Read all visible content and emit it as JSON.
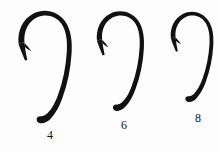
{
  "figure": {
    "background_color": "#fdfdfd",
    "ink_color": "#111111",
    "label_color": "#131313"
  },
  "hooks": [
    {
      "id": "hook-size-4",
      "label": "4",
      "size_number": 4,
      "relative_scale": 1.0,
      "label_x": 50,
      "label_y": 129,
      "bbox": {
        "x": 14,
        "y": 10,
        "width": 58,
        "height": 114
      }
    },
    {
      "id": "hook-size-6",
      "label": "6",
      "size_number": 6,
      "relative_scale": 0.885,
      "label_x": 124,
      "label_y": 119,
      "bbox": {
        "x": 94,
        "y": 10,
        "width": 51,
        "height": 104
      }
    },
    {
      "id": "hook-size-8",
      "label": "8",
      "size_number": 8,
      "relative_scale": 0.8,
      "label_x": 198,
      "label_y": 112,
      "bbox": {
        "x": 167,
        "y": 10,
        "width": 45,
        "height": 95
      }
    }
  ],
  "label_style": {
    "font_size_px": 12
  }
}
